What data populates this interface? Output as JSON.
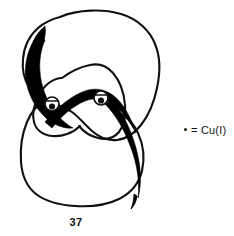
{
  "figure": {
    "kind": "chemical-structure-diagram",
    "compound_label": "37",
    "legend": {
      "symbol": "dot-marker",
      "equals": "=",
      "text": "= Cu(I)",
      "species": "Cu(I)"
    },
    "colors": {
      "ink": "#111111",
      "thick_ribbon": "#000000",
      "background": "#ffffff"
    },
    "metal_centers": [
      {
        "name": "cu-center-left",
        "cx": 52,
        "cy": 104,
        "r": 7
      },
      {
        "name": "cu-center-right",
        "cx": 101,
        "cy": 98,
        "r": 7
      }
    ],
    "rings": [
      {
        "name": "thin-macrocycle-outer",
        "style": "thin-outline"
      },
      {
        "name": "thin-macrocycle-lower",
        "style": "thin-outline"
      },
      {
        "name": "thin-macrocycle-inner-loop",
        "style": "thin-outline"
      },
      {
        "name": "thick-macrocycle",
        "style": "thick-black-ribbon"
      }
    ]
  }
}
